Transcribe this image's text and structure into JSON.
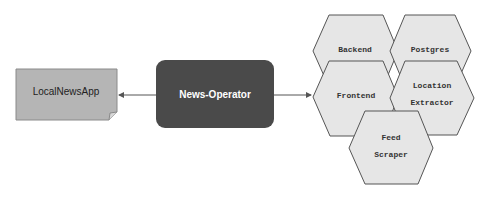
{
  "diagram": {
    "nodes": {
      "app": {
        "label": "LocalNewsApp",
        "shape": "document",
        "fill": "#b5b5b5"
      },
      "operator": {
        "label": "News-Operator",
        "shape": "rounded-rect",
        "fill": "#4a4a4a",
        "text_color": "#ffffff"
      },
      "backend": {
        "label": "Backend",
        "shape": "hexagon"
      },
      "postgres": {
        "label": "Postgres",
        "shape": "hexagon"
      },
      "frontend": {
        "label": "Frontend",
        "shape": "hexagon"
      },
      "location": {
        "line1": "Location",
        "line2": "Extractor",
        "shape": "hexagon"
      },
      "feed": {
        "line1": "Feed",
        "line2": "Scraper",
        "shape": "hexagon"
      }
    },
    "edges": [
      {
        "from": "operator",
        "to": "app"
      },
      {
        "from": "operator",
        "to": "frontend"
      }
    ],
    "colors": {
      "hex_fill": "#e6e6e6",
      "stroke": "#555555"
    }
  }
}
